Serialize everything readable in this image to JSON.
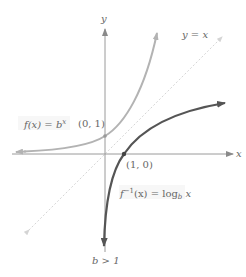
{
  "figure": {
    "type": "function-graph"
  },
  "axes": {
    "x_label": "x",
    "y_label": "y",
    "origin_px": [
      105,
      154
    ],
    "unit_px": 18
  },
  "curves": {
    "exponential": {
      "label_prefix": "f(x) = b",
      "label_exponent": "x",
      "color": "#b3b3b3"
    },
    "logarithm": {
      "label_prefix": "f",
      "label_superscript": "−1",
      "label_middle": "(x) = log",
      "label_subscript": "b",
      "label_suffix": " x",
      "color": "#555555"
    },
    "identity": {
      "label": "y = x",
      "color": "#cfcfcf"
    }
  },
  "points": {
    "exp_intercept": "(0, 1)",
    "log_intercept": "(1, 0)"
  },
  "condition": "b > 1",
  "colors": {
    "axis": "#9a9a9a",
    "exp_curve": "#b3b3b3",
    "log_curve": "#555555",
    "dashed_line": "#d4d4d4",
    "text": "#666666",
    "label_bg": "#f5f5f5"
  }
}
